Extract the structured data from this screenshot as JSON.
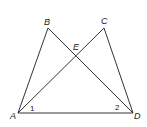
{
  "diagram": {
    "points": {
      "A": {
        "label": "A",
        "x": 18,
        "y": 113
      },
      "B": {
        "label": "B",
        "x": 48,
        "y": 28
      },
      "C": {
        "label": "C",
        "x": 104,
        "y": 28
      },
      "D": {
        "label": "D",
        "x": 133,
        "y": 113
      },
      "E": {
        "label": "E",
        "x": 76,
        "y": 56
      }
    },
    "segments": [
      "AB",
      "BD",
      "AC",
      "CD",
      "AD"
    ],
    "angles": [
      {
        "label": "1",
        "vertex": "A"
      },
      {
        "label": "2",
        "vertex": "D"
      }
    ]
  }
}
